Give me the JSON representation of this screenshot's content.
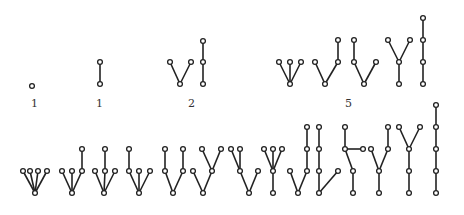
{
  "groups": [
    {
      "nodes": 1,
      "count_label": "1",
      "trees": [
        {
          "parents": [
            -1
          ]
        }
      ]
    },
    {
      "nodes": 2,
      "count_label": "1",
      "trees": [
        {
          "parents": [
            -1,
            0
          ]
        }
      ]
    },
    {
      "nodes": 3,
      "count_label": "2",
      "trees": [
        {
          "parents": [
            -1,
            0,
            0
          ]
        },
        {
          "parents": [
            -1,
            0,
            1
          ]
        }
      ]
    },
    {
      "nodes": 4,
      "count_label": "5",
      "trees": [
        {
          "parents": [
            -1,
            0,
            0,
            0
          ]
        },
        {
          "parents": [
            -1,
            0,
            0,
            2
          ]
        },
        {
          "parents": [
            -1,
            0,
            1,
            0
          ]
        },
        {
          "parents": [
            -1,
            0,
            1,
            1
          ]
        },
        {
          "parents": [
            -1,
            0,
            1,
            2
          ]
        }
      ]
    },
    {
      "nodes": 5,
      "count_label": "14",
      "trees": [
        {
          "parents": [
            -1,
            0,
            0,
            0,
            0
          ]
        },
        {
          "parents": [
            -1,
            0,
            0,
            0,
            3
          ]
        },
        {
          "parents": [
            -1,
            0,
            0,
            2,
            0
          ]
        },
        {
          "parents": [
            -1,
            0,
            1,
            0,
            0
          ]
        },
        {
          "parents": [
            -1,
            0,
            1,
            0,
            3
          ]
        },
        {
          "parents": [
            -1,
            0,
            0,
            2,
            2
          ]
        },
        {
          "parents": [
            -1,
            0,
            1,
            1,
            0
          ]
        },
        {
          "parents": [
            -1,
            0,
            1,
            1,
            1
          ]
        },
        {
          "parents": [
            -1,
            0,
            0,
            2,
            3
          ]
        },
        {
          "parents": [
            -1,
            0,
            1,
            2,
            0
          ]
        },
        {
          "parents": [
            -1,
            0,
            1,
            2,
            2
          ]
        },
        {
          "parents": [
            -1,
            0,
            1,
            1,
            3
          ]
        },
        {
          "parents": [
            -1,
            0,
            1,
            2,
            2
          ]
        },
        {
          "parents": [
            -1,
            0,
            1,
            2,
            3
          ]
        }
      ]
    }
  ],
  "visible_labels": [
    "1",
    "1",
    "2",
    "5"
  ]
}
